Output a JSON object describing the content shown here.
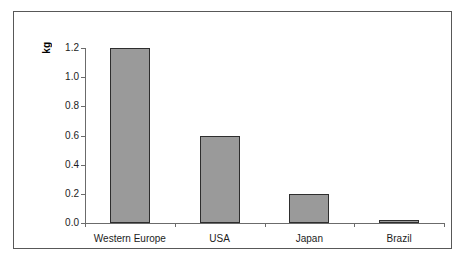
{
  "chart_data": {
    "type": "bar",
    "title": "",
    "xlabel": "",
    "ylabel": "kg",
    "categories": [
      "Western Europe",
      "USA",
      "Japan",
      "Brazil"
    ],
    "values": [
      1.2,
      0.6,
      0.2,
      0.015
    ],
    "ylim": [
      0.0,
      1.2
    ],
    "ytick_labels": [
      "1.2",
      "1.0",
      "0.8",
      "0.6",
      "0.4",
      "0.2",
      "0.0"
    ],
    "ytick_values": [
      1.2,
      1.0,
      0.8,
      0.6,
      0.4,
      0.2,
      0.0
    ],
    "grid": false,
    "legend": false,
    "bar_color": "#9a9a9a",
    "bar_border_color": "#2e2e2e",
    "axis_color": "#6b6b6b",
    "frame_color": "#585858",
    "background": "#ffffff"
  }
}
